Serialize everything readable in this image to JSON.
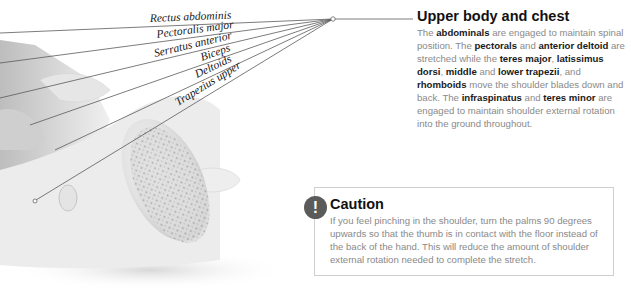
{
  "illustration": {
    "labels": [
      {
        "text": "Rectus abdominis"
      },
      {
        "text": "Pectoralis major"
      },
      {
        "text": "Serratus anterior"
      },
      {
        "text": "Biceps"
      },
      {
        "text": "Deltoids"
      },
      {
        "text": "Trapezius upper"
      }
    ]
  },
  "section": {
    "title": "Upper body and chest",
    "body": [
      {
        "t": "The ",
        "b": false
      },
      {
        "t": "abdominals",
        "b": true
      },
      {
        "t": " are engaged to maintain spinal position. The ",
        "b": false
      },
      {
        "t": "pectorals",
        "b": true
      },
      {
        "t": " and ",
        "b": false
      },
      {
        "t": "anterior deltoid",
        "b": true
      },
      {
        "t": " are stretched while the ",
        "b": false
      },
      {
        "t": "teres major",
        "b": true
      },
      {
        "t": ", ",
        "b": false
      },
      {
        "t": "latissimus dorsi",
        "b": true
      },
      {
        "t": ", ",
        "b": false
      },
      {
        "t": "middle",
        "b": true
      },
      {
        "t": " and ",
        "b": false
      },
      {
        "t": "lower trapezii",
        "b": true
      },
      {
        "t": ", and ",
        "b": false
      },
      {
        "t": "rhomboids",
        "b": true
      },
      {
        "t": " move the shoulder blades down and back. The ",
        "b": false
      },
      {
        "t": "infraspinatus",
        "b": true
      },
      {
        "t": " and ",
        "b": false
      },
      {
        "t": "teres minor",
        "b": true
      },
      {
        "t": " are engaged to maintain shoulder external rotation into the ground throughout.",
        "b": false
      }
    ]
  },
  "caution": {
    "icon": "exclamation-icon",
    "icon_glyph": "!",
    "title": "Caution",
    "text": "If you feel pinching in the shoulder, turn the palms 90 degrees upwards so that the thumb is in contact with the floor instead of the back of the hand. This will reduce the amount of shoulder external rotation needed to complete the stretch."
  }
}
